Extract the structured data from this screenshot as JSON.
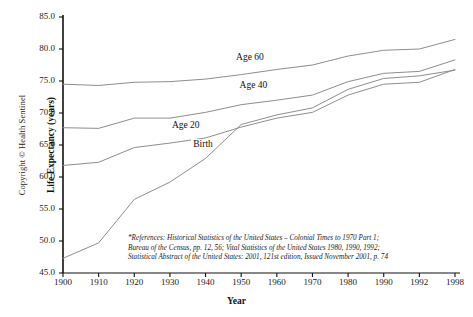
{
  "copyright": "Copyright © Health Sentinel",
  "chart_data": {
    "type": "line",
    "title": "",
    "xlabel": "Year",
    "ylabel": "Life Expectancy (years)",
    "xlim": [
      1900,
      1998
    ],
    "ylim": [
      45.0,
      85.0
    ],
    "grid": false,
    "legend_position": "inline-labels",
    "categories": [
      1900,
      1910,
      1920,
      1930,
      1940,
      1950,
      1960,
      1970,
      1980,
      1990,
      1992,
      1998
    ],
    "xtick_labels": [
      "1900",
      "1910",
      "1920",
      "1930",
      "1940",
      "1950",
      "1960",
      "1970",
      "1980",
      "1990",
      "1992",
      "1998"
    ],
    "ytick_labels": [
      "45.0",
      "50.0",
      "55.0",
      "60.0",
      "65.0",
      "70.0",
      "75.0",
      "80.0",
      "85.0"
    ],
    "ytick_values": [
      45.0,
      50.0,
      55.0,
      60.0,
      65.0,
      70.0,
      75.0,
      80.0,
      85.0
    ],
    "series": [
      {
        "name": "Age 60",
        "label": "Age 60",
        "label_x": 1948,
        "label_y": 78.6,
        "values": [
          74.5,
          74.3,
          74.8,
          74.9,
          75.3,
          76.0,
          76.8,
          77.5,
          78.9,
          79.8,
          80.0,
          81.5
        ]
      },
      {
        "name": "Age 40",
        "label": "Age 40",
        "label_x": 1949,
        "label_y": 74.2,
        "values": [
          67.7,
          67.6,
          69.2,
          69.2,
          70.1,
          71.3,
          72.0,
          72.8,
          74.9,
          76.2,
          76.5,
          78.3
        ]
      },
      {
        "name": "Age 20",
        "label": "Age 20",
        "label_x": 1930,
        "label_y": 67.9,
        "values": [
          61.8,
          62.3,
          64.6,
          65.3,
          66.1,
          67.8,
          69.2,
          70.1,
          72.8,
          74.5,
          74.8,
          76.8
        ]
      },
      {
        "name": "Birth",
        "label": "Birth",
        "label_x": 1936,
        "label_y": 65.0,
        "values": [
          47.3,
          49.7,
          56.5,
          59.2,
          62.9,
          68.2,
          69.7,
          70.8,
          73.7,
          75.4,
          75.8,
          76.7
        ]
      }
    ],
    "reference_note": [
      "*References: Historical Statistics of the United States – Colonial Times to 1970 Part 1;",
      "Bureau of the Census, pp. 12, 56; Vital Statistics of the United States 1980, 1990, 1992;",
      "Statistical Abstract of the United States: 2001, 121st edition, Issued November 2001, p. 74"
    ]
  },
  "colors": {
    "axis": "#111111",
    "line": "#8e8e8e",
    "text": "#1a1a1a",
    "background": "#ffffff"
  }
}
